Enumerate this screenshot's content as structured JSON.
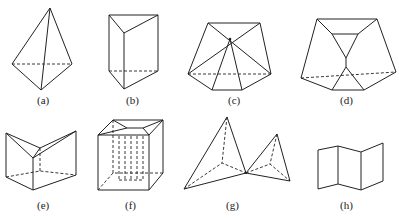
{
  "figure": {
    "stroke_color": "#222222",
    "background": "#ffffff",
    "panels": [
      {
        "id": "a",
        "label": "(a)",
        "shape": "tetrahedron",
        "label_pos": [
          45,
          101
        ]
      },
      {
        "id": "b",
        "label": "(b)",
        "shape": "triangular-prism",
        "label_pos": [
          133,
          101
        ]
      },
      {
        "id": "c",
        "label": "(c)",
        "shape": "pentagonal-pyramid-frustum-like",
        "label_pos": [
          235,
          101
        ]
      },
      {
        "id": "d",
        "label": "(d)",
        "shape": "truncated-polyhedron",
        "label_pos": [
          347,
          101
        ]
      },
      {
        "id": "e",
        "label": "(e)",
        "shape": "folded-prism",
        "label_pos": [
          44,
          206
        ]
      },
      {
        "id": "f",
        "label": "(f)",
        "shape": "cube-with-inner-structure",
        "label_pos": [
          131,
          206
        ]
      },
      {
        "id": "g",
        "label": "(g)",
        "shape": "two-joined-tetrahedra",
        "label_pos": [
          233,
          206
        ]
      },
      {
        "id": "h",
        "label": "(h)",
        "shape": "folded-strip",
        "label_pos": [
          347,
          206
        ]
      }
    ]
  }
}
